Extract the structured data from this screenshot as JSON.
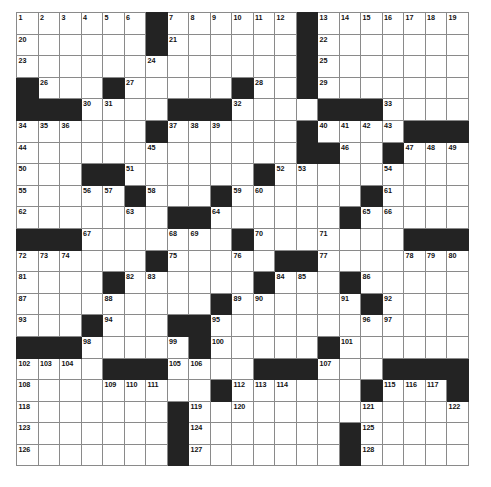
{
  "puzzle": {
    "type": "crossword-grid",
    "rows": 21,
    "cols": 21,
    "cell_size_px": 21.5,
    "colors": {
      "block": "#232323",
      "cell": "#ffffff",
      "grid_line": "#8a8a8a",
      "number_text": "#111111",
      "page_background": "#ffffff"
    },
    "blocks": [
      [
        0,
        6
      ],
      [
        0,
        13
      ],
      [
        1,
        6
      ],
      [
        1,
        13
      ],
      [
        2,
        13
      ],
      [
        3,
        0
      ],
      [
        3,
        4
      ],
      [
        3,
        10
      ],
      [
        3,
        13
      ],
      [
        4,
        0
      ],
      [
        4,
        1
      ],
      [
        4,
        2
      ],
      [
        4,
        7
      ],
      [
        4,
        8
      ],
      [
        4,
        9
      ],
      [
        4,
        14
      ],
      [
        4,
        15
      ],
      [
        4,
        16
      ],
      [
        5,
        6
      ],
      [
        5,
        13
      ],
      [
        5,
        18
      ],
      [
        5,
        19
      ],
      [
        5,
        20
      ],
      [
        6,
        13
      ],
      [
        6,
        14
      ],
      [
        6,
        17
      ],
      [
        7,
        3
      ],
      [
        7,
        4
      ],
      [
        7,
        11
      ],
      [
        8,
        5
      ],
      [
        8,
        9
      ],
      [
        8,
        16
      ],
      [
        9,
        7
      ],
      [
        9,
        8
      ],
      [
        9,
        15
      ],
      [
        10,
        0
      ],
      [
        10,
        1
      ],
      [
        10,
        2
      ],
      [
        10,
        10
      ],
      [
        10,
        18
      ],
      [
        10,
        19
      ],
      [
        10,
        20
      ],
      [
        11,
        6
      ],
      [
        11,
        12
      ],
      [
        11,
        13
      ],
      [
        12,
        4
      ],
      [
        12,
        11
      ],
      [
        12,
        15
      ],
      [
        13,
        9
      ],
      [
        13,
        16
      ],
      [
        14,
        3
      ],
      [
        14,
        7
      ],
      [
        14,
        8
      ],
      [
        15,
        0
      ],
      [
        15,
        1
      ],
      [
        15,
        2
      ],
      [
        15,
        8
      ],
      [
        15,
        14
      ],
      [
        16,
        4
      ],
      [
        16,
        5
      ],
      [
        16,
        6
      ],
      [
        16,
        11
      ],
      [
        16,
        12
      ],
      [
        16,
        13
      ],
      [
        16,
        17
      ],
      [
        16,
        18
      ],
      [
        16,
        19
      ],
      [
        16,
        20
      ],
      [
        17,
        9
      ],
      [
        17,
        16
      ],
      [
        17,
        20
      ],
      [
        18,
        7
      ],
      [
        19,
        7
      ],
      [
        19,
        15
      ],
      [
        20,
        7
      ],
      [
        20,
        15
      ]
    ],
    "numbered_cells": [
      {
        "n": 1,
        "r": 0,
        "c": 0
      },
      {
        "n": 2,
        "r": 0,
        "c": 1
      },
      {
        "n": 3,
        "r": 0,
        "c": 2
      },
      {
        "n": 4,
        "r": 0,
        "c": 3
      },
      {
        "n": 5,
        "r": 0,
        "c": 4
      },
      {
        "n": 6,
        "r": 0,
        "c": 5
      },
      {
        "n": 7,
        "r": 0,
        "c": 7
      },
      {
        "n": 8,
        "r": 0,
        "c": 8
      },
      {
        "n": 9,
        "r": 0,
        "c": 9
      },
      {
        "n": 10,
        "r": 0,
        "c": 10
      },
      {
        "n": 11,
        "r": 0,
        "c": 11
      },
      {
        "n": 12,
        "r": 0,
        "c": 12
      },
      {
        "n": 13,
        "r": 0,
        "c": 14
      },
      {
        "n": 14,
        "r": 0,
        "c": 15
      },
      {
        "n": 15,
        "r": 0,
        "c": 16
      },
      {
        "n": 16,
        "r": 0,
        "c": 17
      },
      {
        "n": 17,
        "r": 0,
        "c": 18
      },
      {
        "n": 18,
        "r": 0,
        "c": 19
      },
      {
        "n": 19,
        "r": 0,
        "c": 20
      },
      {
        "n": 20,
        "r": 1,
        "c": 0
      },
      {
        "n": 21,
        "r": 1,
        "c": 7
      },
      {
        "n": 22,
        "r": 1,
        "c": 14
      },
      {
        "n": 23,
        "r": 2,
        "c": 0
      },
      {
        "n": 24,
        "r": 2,
        "c": 6
      },
      {
        "n": 25,
        "r": 2,
        "c": 14
      },
      {
        "n": 26,
        "r": 3,
        "c": 1
      },
      {
        "n": 27,
        "r": 3,
        "c": 5
      },
      {
        "n": 28,
        "r": 3,
        "c": 11
      },
      {
        "n": 29,
        "r": 3,
        "c": 14
      },
      {
        "n": 30,
        "r": 4,
        "c": 3
      },
      {
        "n": 31,
        "r": 4,
        "c": 4
      },
      {
        "n": 32,
        "r": 4,
        "c": 10
      },
      {
        "n": 33,
        "r": 4,
        "c": 17
      },
      {
        "n": 34,
        "r": 5,
        "c": 0
      },
      {
        "n": 35,
        "r": 5,
        "c": 1
      },
      {
        "n": 36,
        "r": 5,
        "c": 2
      },
      {
        "n": 37,
        "r": 5,
        "c": 7
      },
      {
        "n": 38,
        "r": 5,
        "c": 8
      },
      {
        "n": 39,
        "r": 5,
        "c": 9
      },
      {
        "n": 40,
        "r": 5,
        "c": 14
      },
      {
        "n": 41,
        "r": 5,
        "c": 15
      },
      {
        "n": 42,
        "r": 5,
        "c": 16
      },
      {
        "n": 43,
        "r": 5,
        "c": 17
      },
      {
        "n": 44,
        "r": 6,
        "c": 0
      },
      {
        "n": 45,
        "r": 6,
        "c": 6
      },
      {
        "n": 46,
        "r": 6,
        "c": 15
      },
      {
        "n": 47,
        "r": 6,
        "c": 18
      },
      {
        "n": 48,
        "r": 6,
        "c": 19
      },
      {
        "n": 49,
        "r": 6,
        "c": 20
      },
      {
        "n": 50,
        "r": 7,
        "c": 0
      },
      {
        "n": 51,
        "r": 7,
        "c": 5
      },
      {
        "n": 52,
        "r": 7,
        "c": 12
      },
      {
        "n": 53,
        "r": 7,
        "c": 13
      },
      {
        "n": 54,
        "r": 7,
        "c": 17
      },
      {
        "n": 55,
        "r": 8,
        "c": 0
      },
      {
        "n": 56,
        "r": 8,
        "c": 3
      },
      {
        "n": 57,
        "r": 8,
        "c": 4
      },
      {
        "n": 58,
        "r": 8,
        "c": 6
      },
      {
        "n": 59,
        "r": 8,
        "c": 10
      },
      {
        "n": 60,
        "r": 8,
        "c": 11
      },
      {
        "n": 61,
        "r": 8,
        "c": 17
      },
      {
        "n": 62,
        "r": 9,
        "c": 0
      },
      {
        "n": 63,
        "r": 9,
        "c": 5
      },
      {
        "n": 64,
        "r": 9,
        "c": 9
      },
      {
        "n": 65,
        "r": 9,
        "c": 16
      },
      {
        "n": 66,
        "r": 9,
        "c": 17
      },
      {
        "n": 67,
        "r": 10,
        "c": 3
      },
      {
        "n": 68,
        "r": 10,
        "c": 7
      },
      {
        "n": 69,
        "r": 10,
        "c": 8
      },
      {
        "n": 70,
        "r": 10,
        "c": 11
      },
      {
        "n": 71,
        "r": 10,
        "c": 14
      },
      {
        "n": 72,
        "r": 11,
        "c": 0
      },
      {
        "n": 73,
        "r": 11,
        "c": 1
      },
      {
        "n": 74,
        "r": 11,
        "c": 2
      },
      {
        "n": 75,
        "r": 11,
        "c": 7
      },
      {
        "n": 76,
        "r": 11,
        "c": 10
      },
      {
        "n": 77,
        "r": 11,
        "c": 14
      },
      {
        "n": 78,
        "r": 11,
        "c": 18
      },
      {
        "n": 79,
        "r": 11,
        "c": 19
      },
      {
        "n": 80,
        "r": 11,
        "c": 20
      },
      {
        "n": 81,
        "r": 12,
        "c": 0
      },
      {
        "n": 82,
        "r": 12,
        "c": 5
      },
      {
        "n": 83,
        "r": 12,
        "c": 6
      },
      {
        "n": 84,
        "r": 12,
        "c": 12
      },
      {
        "n": 85,
        "r": 12,
        "c": 13
      },
      {
        "n": 86,
        "r": 12,
        "c": 16
      },
      {
        "n": 87,
        "r": 13,
        "c": 0
      },
      {
        "n": 88,
        "r": 13,
        "c": 4
      },
      {
        "n": 89,
        "r": 13,
        "c": 10
      },
      {
        "n": 90,
        "r": 13,
        "c": 11
      },
      {
        "n": 91,
        "r": 13,
        "c": 15
      },
      {
        "n": 92,
        "r": 13,
        "c": 17
      },
      {
        "n": 93,
        "r": 14,
        "c": 0
      },
      {
        "n": 94,
        "r": 14,
        "c": 4
      },
      {
        "n": 95,
        "r": 14,
        "c": 9
      },
      {
        "n": 96,
        "r": 14,
        "c": 16
      },
      {
        "n": 97,
        "r": 14,
        "c": 17
      },
      {
        "n": 98,
        "r": 15,
        "c": 3
      },
      {
        "n": 99,
        "r": 15,
        "c": 7
      },
      {
        "n": 100,
        "r": 15,
        "c": 9
      },
      {
        "n": 101,
        "r": 15,
        "c": 15
      },
      {
        "n": 102,
        "r": 16,
        "c": 0
      },
      {
        "n": 103,
        "r": 16,
        "c": 1
      },
      {
        "n": 104,
        "r": 16,
        "c": 2
      },
      {
        "n": 105,
        "r": 16,
        "c": 7
      },
      {
        "n": 106,
        "r": 16,
        "c": 8
      },
      {
        "n": 107,
        "r": 16,
        "c": 14
      },
      {
        "n": 108,
        "r": 17,
        "c": 0
      },
      {
        "n": 109,
        "r": 17,
        "c": 4
      },
      {
        "n": 110,
        "r": 17,
        "c": 5
      },
      {
        "n": 111,
        "r": 17,
        "c": 6
      },
      {
        "n": 112,
        "r": 17,
        "c": 10
      },
      {
        "n": 113,
        "r": 17,
        "c": 11
      },
      {
        "n": 114,
        "r": 17,
        "c": 12
      },
      {
        "n": 115,
        "r": 17,
        "c": 17
      },
      {
        "n": 116,
        "r": 17,
        "c": 18
      },
      {
        "n": 117,
        "r": 17,
        "c": 19
      },
      {
        "n": 118,
        "r": 18,
        "c": 0
      },
      {
        "n": 119,
        "r": 18,
        "c": 8
      },
      {
        "n": 120,
        "r": 18,
        "c": 10
      },
      {
        "n": 121,
        "r": 18,
        "c": 16
      },
      {
        "n": 122,
        "r": 18,
        "c": 20
      },
      {
        "n": 123,
        "r": 19,
        "c": 0
      },
      {
        "n": 124,
        "r": 19,
        "c": 8
      },
      {
        "n": 125,
        "r": 19,
        "c": 16
      },
      {
        "n": 126,
        "r": 20,
        "c": 0
      },
      {
        "n": 127,
        "r": 20,
        "c": 8
      },
      {
        "n": 128,
        "r": 20,
        "c": 16
      }
    ]
  }
}
